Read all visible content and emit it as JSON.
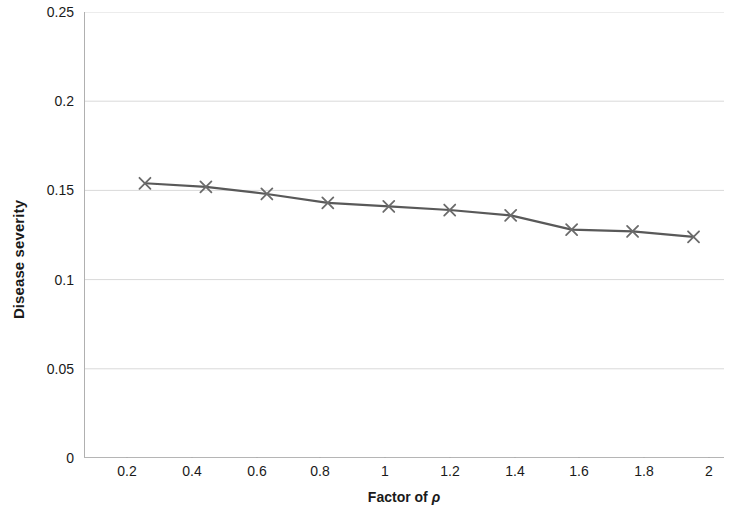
{
  "chart_data": {
    "type": "line",
    "title": "",
    "subtitle": "",
    "xlabel": "Factor of ρ",
    "xlabel_prefix": "Factor of ",
    "xlabel_symbol": "ρ",
    "ylabel": "Disease severity",
    "x": [
      0.2,
      0.4,
      0.6,
      0.8,
      1,
      1.2,
      1.4,
      1.6,
      1.8,
      2
    ],
    "values": [
      0.154,
      0.152,
      0.148,
      0.143,
      0.141,
      0.139,
      0.136,
      0.128,
      0.127,
      0.124
    ],
    "series": [
      {
        "name": "Disease severity",
        "values": [
          0.154,
          0.152,
          0.148,
          0.143,
          0.141,
          0.139,
          0.136,
          0.128,
          0.127,
          0.124
        ]
      }
    ],
    "xlim": [
      0,
      2.1
    ],
    "ylim": [
      0,
      0.25
    ],
    "x_tick_labels": [
      "0.2",
      "0.4",
      "0.6",
      "0.8",
      "1",
      "1.2",
      "1.4",
      "1.6",
      "1.8",
      "2"
    ],
    "y_tick_labels": [
      "0",
      "0.05",
      "0.1",
      "0.15",
      "0.2",
      "0.25"
    ],
    "y_tick_values": [
      0,
      0.05,
      0.1,
      0.15,
      0.2,
      0.25
    ],
    "grid": true,
    "grid_axis": "y",
    "legend": false,
    "legend_position": "none",
    "marker": "x-cross",
    "line_color": "#595959",
    "marker_color": "#6b6b6b",
    "grid_color": "#d9d9d9",
    "axis_color": "#9a9a9a",
    "background_color": "#ffffff"
  }
}
